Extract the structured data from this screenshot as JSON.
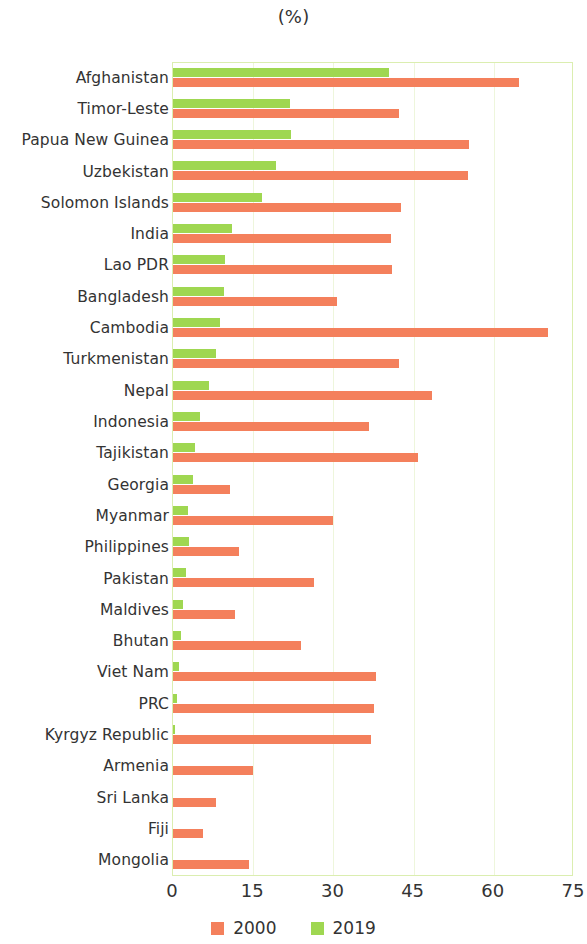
{
  "subtitle": "(%)",
  "legend": {
    "position": "bottom-center",
    "items": [
      {
        "label": "2000",
        "color": "#f4805c"
      },
      {
        "label": "2019",
        "color": "#9fd751"
      }
    ]
  },
  "axis": {
    "ticks": [
      "0",
      "15",
      "30",
      "45",
      "60",
      "75"
    ],
    "min": 0,
    "max": 75
  },
  "colors": {
    "series_2000": "#f4805c",
    "series_2019": "#9fd751",
    "plot_border": "#dbeeb0",
    "gridline": "#eef6dc",
    "text": "#333333"
  },
  "chart_data": {
    "type": "bar",
    "orientation": "horizontal",
    "title": "(%)",
    "subtitle": "(%)",
    "xlabel": "",
    "ylabel": "",
    "xlim": [
      0,
      75
    ],
    "xticks": [
      0,
      15,
      30,
      45,
      60,
      75
    ],
    "grid": true,
    "legend_position": "bottom-center",
    "categories": [
      "Afghanistan",
      "Timor-Leste",
      "Papua New Guinea",
      "Uzbekistan",
      "Solomon Islands",
      "India",
      "Lao PDR",
      "Bangladesh",
      "Cambodia",
      "Turkmenistan",
      "Nepal",
      "Indonesia",
      "Tajikistan",
      "Georgia",
      "Myanmar",
      "Philippines",
      "Pakistan",
      "Maldives",
      "Bhutan",
      "Viet Nam",
      "PRC",
      "Kyrgyz Republic",
      "Armenia",
      "Sri Lanka",
      "Fiji",
      "Mongolia"
    ],
    "series": [
      {
        "name": "2000",
        "color": "#f4805c",
        "values": [
          64.7,
          42.2,
          55.4,
          55.2,
          42.6,
          40.7,
          41.0,
          30.6,
          70.1,
          42.2,
          48.4,
          36.6,
          45.8,
          10.7,
          29.9,
          12.3,
          26.4,
          11.6,
          24.0,
          38.0,
          37.6,
          37.0,
          15.0,
          8.0,
          5.6,
          14.2
        ]
      },
      {
        "name": "2019",
        "color": "#9fd751",
        "values": [
          40.4,
          21.8,
          22.1,
          19.3,
          16.7,
          11.0,
          9.8,
          9.5,
          8.8,
          8.0,
          6.7,
          5.0,
          4.2,
          3.7,
          2.8,
          3.0,
          2.5,
          1.9,
          1.5,
          1.2,
          0.7,
          0.4,
          0.0,
          0.0,
          0.0,
          0.0
        ]
      }
    ]
  }
}
